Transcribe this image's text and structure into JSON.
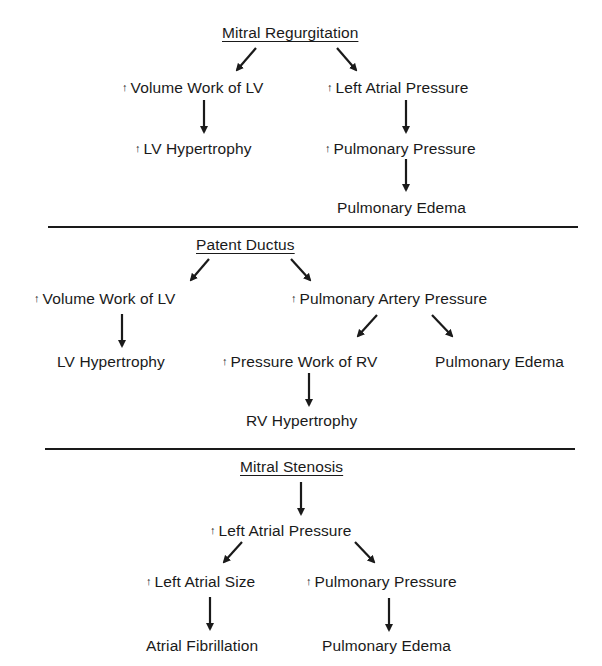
{
  "icons": {
    "increase": "↑",
    "arrow": "arrow-icon"
  },
  "sections": [
    {
      "title": "Mitral Regurgitation",
      "nodes": {
        "n1": {
          "label": "Volume Work of LV",
          "increase": true
        },
        "n2": {
          "label": "Left Atrial Pressure",
          "increase": true
        },
        "n3": {
          "label": "LV Hypertrophy",
          "increase": true
        },
        "n4": {
          "label": "Pulmonary Pressure",
          "increase": true
        },
        "n5": {
          "label": "Pulmonary Edema",
          "increase": false
        }
      }
    },
    {
      "title": "Patent Ductus",
      "nodes": {
        "n1": {
          "label": "Volume Work of LV",
          "increase": true
        },
        "n2": {
          "label": "Pulmonary Artery Pressure",
          "increase": true
        },
        "n3": {
          "label": "LV Hypertrophy",
          "increase": false
        },
        "n4": {
          "label": "Pressure Work of RV",
          "increase": true
        },
        "n5": {
          "label": "Pulmonary Edema",
          "increase": false
        },
        "n6": {
          "label": "RV Hypertrophy",
          "increase": false
        }
      }
    },
    {
      "title": "Mitral Stenosis",
      "nodes": {
        "n1": {
          "label": "Left Atrial Pressure",
          "increase": true
        },
        "n2": {
          "label": "Left Atrial Size",
          "increase": true
        },
        "n3": {
          "label": "Pulmonary Pressure",
          "increase": true
        },
        "n4": {
          "label": "Atrial Fibrillation",
          "increase": false
        },
        "n5": {
          "label": "Pulmonary Edema",
          "increase": false
        }
      }
    }
  ]
}
